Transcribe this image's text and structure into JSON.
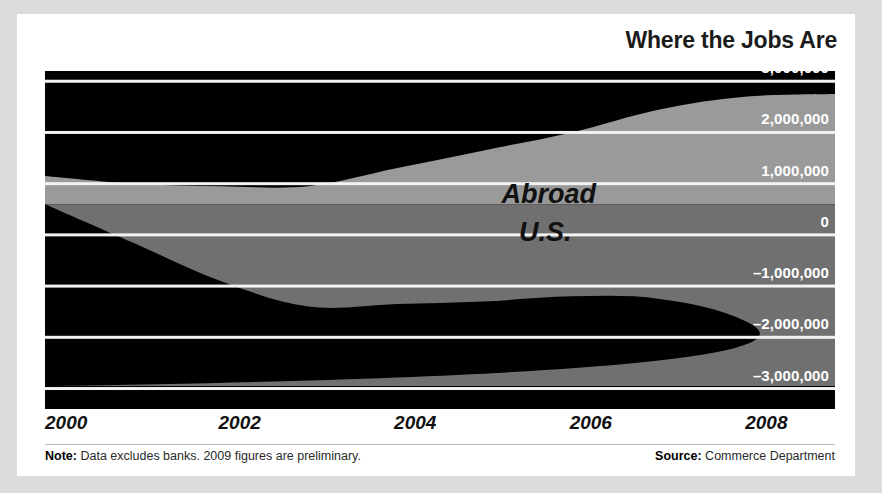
{
  "header": {
    "title": "Where the Jobs Are"
  },
  "footer": {
    "note_label": "Note:",
    "note_text": " Data excludes banks. 2009 figures are preliminary.",
    "source_label": "Source:",
    "source_text": " Commerce Department"
  },
  "colors": {
    "page_background": "#dcdcdc",
    "card_background": "#ffffff",
    "plot_background": "#000000",
    "abroad_fill": "#9a9a9a",
    "us_fill": "#707070",
    "gridline": "#f2f2f2",
    "axis_text": "#ffffff",
    "series_text": "#111111"
  },
  "chart_data": {
    "type": "area",
    "title": "Where the Jobs Are",
    "subtitle": "",
    "xlabel": "",
    "ylabel": "",
    "xlim": [
      2000,
      2009
    ],
    "ylim": [
      -3400000,
      3200000
    ],
    "grid": true,
    "legend_position": "inline-labels",
    "y_ticks": [
      3000000,
      2000000,
      1000000,
      0,
      -1000000,
      -2000000,
      -3000000
    ],
    "y_tick_labels": [
      "3,000,000",
      "2,000,000",
      "1,000,000",
      "0",
      "-1,000,000",
      "-2,000,000",
      "-3,000,000"
    ],
    "x_ticks": [
      2000,
      2002,
      2004,
      2006,
      2008
    ],
    "x_tick_labels": [
      "2000",
      "2002",
      "2004",
      "2006",
      "2008"
    ],
    "x": [
      2000,
      2001,
      2002,
      2003,
      2004,
      2005,
      2006,
      2007,
      2008,
      2009
    ],
    "series": [
      {
        "name": "Abroad",
        "fill": "#9a9a9a",
        "band_top": [
          1150000,
          1000000,
          950000,
          950000,
          1300000,
          1650000,
          2000000,
          2450000,
          2700000,
          2750000
        ],
        "band_bottom": [
          600000,
          600000,
          600000,
          600000,
          600000,
          600000,
          600000,
          600000,
          600000,
          600000
        ]
      },
      {
        "name": "U.S.",
        "fill": "#707070",
        "band_top": [
          600000,
          600000,
          600000,
          600000,
          600000,
          600000,
          600000,
          600000,
          600000,
          600000
        ],
        "band_bottom": [
          600000,
          -150000,
          -900000,
          -1400000,
          -1350000,
          -1300000,
          -1200000,
          -1250000,
          -1700000,
          -2950000
        ]
      }
    ],
    "annotations": [
      {
        "text": "Abroad",
        "x": 2005.2,
        "y": 700000
      },
      {
        "text": "U.S.",
        "x": 2005.4,
        "y": -50000
      }
    ]
  }
}
